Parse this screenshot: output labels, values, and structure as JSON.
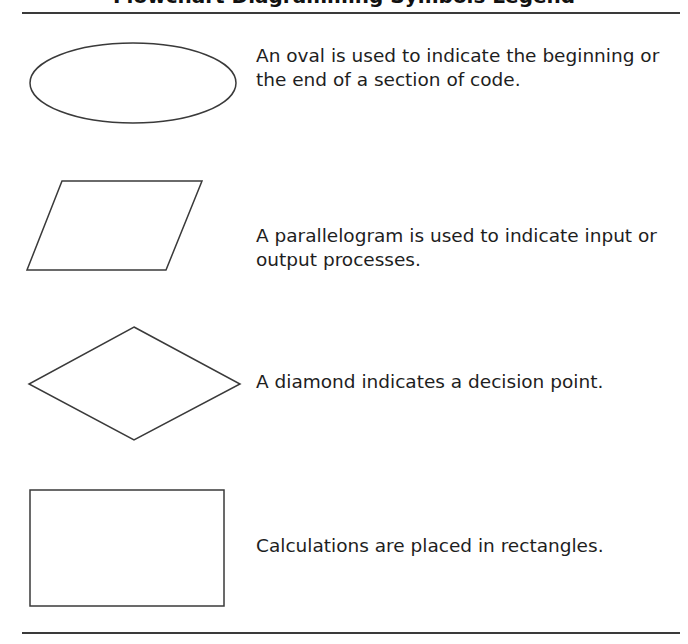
{
  "figure": {
    "title": "Flowchart Diagramming Symbols Legend",
    "title_visible": "clipped at top; only descenders visible",
    "colors": {
      "stroke": "#3a3a3a",
      "text": "#1e1e1e",
      "background": "#ffffff"
    },
    "symbols": [
      {
        "shape": "oval",
        "description": "An oval is used to indicate the beginning or the end of a section of code."
      },
      {
        "shape": "parallelogram",
        "description": "A parallelogram is used to indicate input or output processes."
      },
      {
        "shape": "diamond",
        "description": "A diamond indicates a decision point."
      },
      {
        "shape": "rectangle",
        "description": "Calculations are placed in rectangles."
      }
    ]
  }
}
